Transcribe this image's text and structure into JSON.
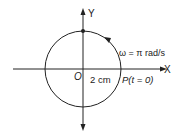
{
  "diagram": {
    "axes": {
      "x_label": "X",
      "y_label": "Y",
      "origin_label": "O"
    },
    "circle": {
      "radius_label": "2 cm",
      "angular_velocity_label": "ω = π rad/s",
      "direction": "counterclockwise"
    },
    "point": {
      "label": "P(t = 0)"
    },
    "colors": {
      "stroke": "#222222",
      "background": "#ffffff"
    }
  }
}
